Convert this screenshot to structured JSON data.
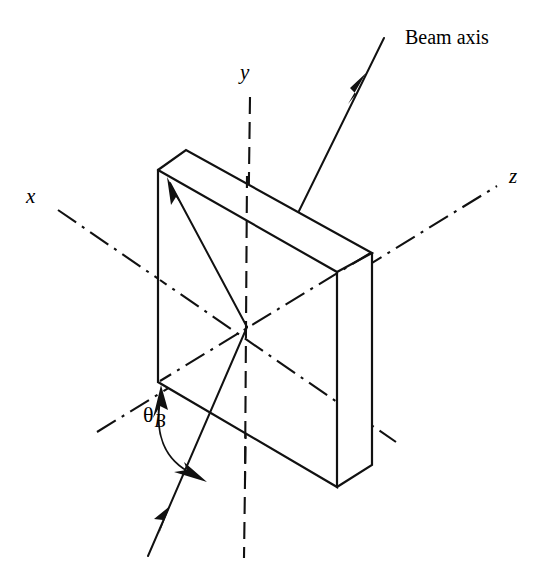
{
  "figure": {
    "kind": "3d-line-diagram",
    "title_text": "",
    "background_color": "#ffffff",
    "line_color": "#111111",
    "width": 545,
    "height": 585
  },
  "labels": {
    "beam_axis": "Beam axis",
    "x_axis": "x",
    "y_axis": "y",
    "z_axis": "z",
    "bragg_angle_symbol": "θ",
    "bragg_angle_subscript": "B"
  },
  "geometry": {
    "origin": {
      "x": 247,
      "y": 327
    },
    "axes": [
      {
        "name": "x-axis",
        "label": "x",
        "style": "dash-dot",
        "from": {
          "x": 58,
          "y": 210
        },
        "to": {
          "x": 396,
          "y": 442
        },
        "label_pos": {
          "x": 26,
          "y": 188
        }
      },
      {
        "name": "y-axis",
        "label": "y",
        "style": "dash-dot",
        "from": {
          "x": 250,
          "y": 97
        },
        "to": {
          "x": 244,
          "y": 558
        },
        "label_pos": {
          "x": 238,
          "y": 62
        }
      },
      {
        "name": "z-axis",
        "label": "z",
        "style": "dash-dot",
        "from": {
          "x": 97,
          "y": 432
        },
        "to": {
          "x": 497,
          "y": 186
        },
        "label_pos": {
          "x": 508,
          "y": 166
        }
      }
    ],
    "slab": {
      "description": "rectangular crystal slab drawn in oblique projection",
      "front_face": [
        {
          "x": 158,
          "y": 170
        },
        {
          "x": 337,
          "y": 272
        },
        {
          "x": 337,
          "y": 487
        },
        {
          "x": 158,
          "y": 382
        }
      ],
      "top_face": [
        {
          "x": 158,
          "y": 170
        },
        {
          "x": 186,
          "y": 150
        },
        {
          "x": 372,
          "y": 253
        },
        {
          "x": 337,
          "y": 272
        }
      ],
      "right_face": [
        {
          "x": 337,
          "y": 272
        },
        {
          "x": 372,
          "y": 253
        },
        {
          "x": 372,
          "y": 465
        },
        {
          "x": 337,
          "y": 487
        }
      ]
    },
    "beams": [
      {
        "name": "incident-beam",
        "from": {
          "x": 148,
          "y": 556
        },
        "to": {
          "x": 247,
          "y": 327
        },
        "arrow_at": {
          "x": 167,
          "y": 513
        },
        "direction": "up-right"
      },
      {
        "name": "reflected-beam-to-surface",
        "from": {
          "x": 247,
          "y": 327
        },
        "to": {
          "x": 168,
          "y": 180
        },
        "arrow_at": {
          "x": 172,
          "y": 188
        },
        "direction": "up-left"
      },
      {
        "name": "beam-axis-outgoing",
        "from": {
          "x": 299,
          "y": 211
        },
        "to": {
          "x": 384,
          "y": 38
        },
        "arrow_at": {
          "x": 356,
          "y": 94
        },
        "direction": "up-right"
      }
    ],
    "angle_arc": {
      "name": "bragg-angle-arc",
      "center": {
        "x": 247,
        "y": 327
      },
      "start_point": {
        "x": 160,
        "y": 394
      },
      "end_point": {
        "x": 199,
        "y": 470
      },
      "double_headed": true,
      "label_pos": {
        "x": 143,
        "y": 405
      }
    },
    "beam_axis_label_pos": {
      "x": 405,
      "y": 27
    }
  }
}
